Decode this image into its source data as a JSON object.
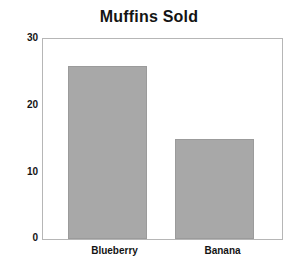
{
  "chart_data": {
    "type": "bar",
    "title": "Muffins Sold",
    "xlabel": "",
    "ylabel": "",
    "categories": [
      "Blueberry",
      "Banana"
    ],
    "values": [
      26,
      15
    ],
    "ylim": [
      0,
      30
    ],
    "yticks": [
      0,
      10,
      20,
      30
    ],
    "ytick_labels": [
      "0",
      "10",
      "20",
      "30"
    ],
    "grid": false,
    "legend": null,
    "legend_position": "none",
    "colors": {
      "bar_fill": "#a8a8a8",
      "bar_edge": "#9b9b9b",
      "frame": "#b6b6b6",
      "text": "#141414",
      "background": "#ffffff"
    }
  }
}
